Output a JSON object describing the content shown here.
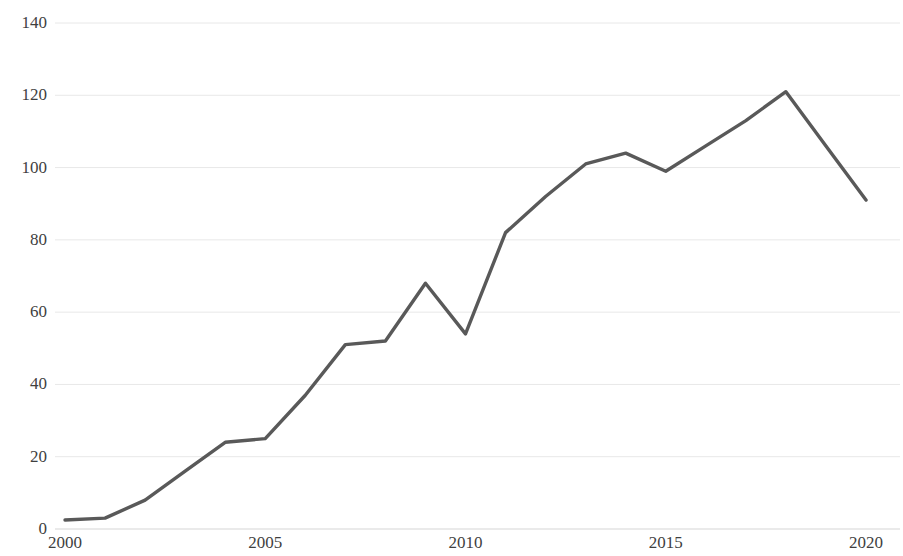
{
  "chart_data": {
    "type": "line",
    "title": "",
    "subtitle": "",
    "xlabel": "",
    "ylabel": "",
    "grid": true,
    "grid_axis": "y",
    "legend": false,
    "legend_position": "none",
    "line_color": "#595959",
    "background_color": "#ffffff",
    "gridline_color": "#e8e8e8",
    "tick_label_color": "#3f3f3f",
    "xlim": [
      2000,
      2020
    ],
    "ylim": [
      0,
      140
    ],
    "x_ticks": [
      2000,
      2005,
      2010,
      2015,
      2020
    ],
    "x_tick_labels": [
      "2000",
      "2005",
      "2010",
      "2015",
      "2020"
    ],
    "y_ticks": [
      0,
      20,
      40,
      60,
      80,
      100,
      120,
      140
    ],
    "y_tick_labels": [
      "0",
      "20",
      "40",
      "60",
      "80",
      "100",
      "120",
      "140"
    ],
    "x": [
      2000,
      2001,
      2002,
      2003,
      2004,
      2005,
      2006,
      2007,
      2008,
      2009,
      2010,
      2011,
      2012,
      2013,
      2014,
      2015,
      2016,
      2017,
      2018,
      2019,
      2020
    ],
    "values": [
      2.5,
      3,
      8,
      16,
      24,
      25,
      37,
      51,
      52,
      68,
      54,
      82,
      92,
      101,
      104,
      99,
      106,
      113,
      121,
      106,
      91
    ],
    "series": [
      {
        "name": "",
        "values": [
          2.5,
          3,
          8,
          16,
          24,
          25,
          37,
          51,
          52,
          68,
          54,
          82,
          92,
          101,
          104,
          99,
          106,
          113,
          121,
          106,
          91
        ]
      }
    ]
  }
}
